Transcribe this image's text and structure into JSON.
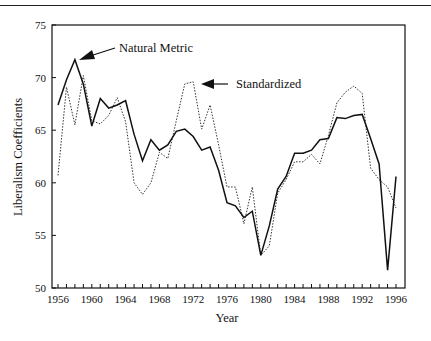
{
  "chart_data": {
    "type": "line",
    "title": "",
    "xlabel": "Year",
    "ylabel": "Liberalism Coefficients",
    "xlim": [
      1956,
      1996
    ],
    "ylim": [
      50,
      75
    ],
    "x_ticks": [
      "1956",
      "1960",
      "1964",
      "1968",
      "1972",
      "1976",
      "1980",
      "1984",
      "1988",
      "1992",
      "1996"
    ],
    "y_ticks": [
      "50",
      "55",
      "60",
      "65",
      "70",
      "75"
    ],
    "grid": false,
    "legend": "annotations with arrows",
    "x": [
      1956,
      1957,
      1958,
      1959,
      1960,
      1961,
      1962,
      1963,
      1964,
      1965,
      1966,
      1967,
      1968,
      1969,
      1970,
      1971,
      1972,
      1973,
      1974,
      1975,
      1976,
      1977,
      1978,
      1979,
      1980,
      1981,
      1982,
      1983,
      1984,
      1985,
      1986,
      1987,
      1988,
      1989,
      1990,
      1991,
      1992,
      1993,
      1994,
      1995,
      1996
    ],
    "series": [
      {
        "name": "Natural Metric",
        "style": "solid",
        "values": [
          67.4,
          69.8,
          71.7,
          69.4,
          65.4,
          68.0,
          67.1,
          67.4,
          67.8,
          64.6,
          62.1,
          64.1,
          63.1,
          63.6,
          64.9,
          65.1,
          64.4,
          63.1,
          63.4,
          61.2,
          58.1,
          57.8,
          56.7,
          57.3,
          53.1,
          55.9,
          59.4,
          60.6,
          62.8,
          62.8,
          63.1,
          64.1,
          64.2,
          66.2,
          66.1,
          66.4,
          66.5,
          64.2,
          61.8,
          51.7,
          60.6
        ]
      },
      {
        "name": "Standardized",
        "style": "dotted",
        "values": [
          60.7,
          69.1,
          65.5,
          70.2,
          65.9,
          65.6,
          66.4,
          68.1,
          65.8,
          60.0,
          58.9,
          60.0,
          62.9,
          62.3,
          65.9,
          69.4,
          69.6,
          65.1,
          67.4,
          63.6,
          59.6,
          59.6,
          56.1,
          59.6,
          53.1,
          54.0,
          59.0,
          60.3,
          62.0,
          62.0,
          62.7,
          61.8,
          64.5,
          67.6,
          68.6,
          69.2,
          68.5,
          61.4,
          60.3,
          59.6,
          57.6
        ]
      }
    ],
    "annotations": [
      {
        "text": "Natural Metric",
        "points_to": [
          1958,
          71.7
        ]
      },
      {
        "text": "Standardized",
        "points_to": [
          1972,
          69.6
        ]
      }
    ]
  },
  "labels": {
    "xlabel": "Year",
    "ylabel": "Liberalism Coefficients",
    "annot_natural": "Natural Metric",
    "annot_standardized": "Standardized"
  }
}
